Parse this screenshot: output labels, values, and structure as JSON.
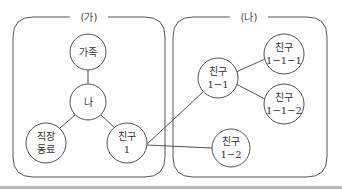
{
  "groups": [
    {
      "id": "ga",
      "label": "(가)"
    },
    {
      "id": "na",
      "label": "(나)"
    }
  ],
  "nodes": {
    "family": {
      "line1": "가족",
      "line2": ""
    },
    "me": {
      "line1": "나",
      "line2": ""
    },
    "coworker": {
      "line1": "직장",
      "line2": "동료"
    },
    "friend1": {
      "line1": "친구",
      "line2": "1"
    },
    "friend1_1": {
      "line1": "친구",
      "line2": "1−1"
    },
    "friend1_2": {
      "line1": "친구",
      "line2": "1−2"
    },
    "friend1_1_1": {
      "line1": "친구",
      "line2": "1−1−1"
    },
    "friend1_1_2": {
      "line1": "친구",
      "line2": "1−1−2"
    }
  },
  "colors": {
    "stroke": "#555555",
    "text": "#333333",
    "rule": "#b8b8b8"
  }
}
